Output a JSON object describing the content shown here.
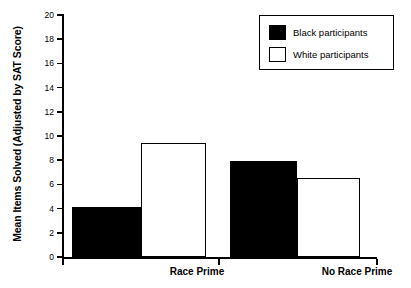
{
  "chart_data": {
    "type": "bar",
    "title": "",
    "subtitle": "",
    "xlabel": "",
    "ylabel": "Mean Items Solved (Adjusted by SAT Score)",
    "categories": [
      "Race Prime",
      "No Race Prime"
    ],
    "series": [
      {
        "name": "Black participants",
        "values": [
          4.1,
          7.9
        ],
        "color": "#000000",
        "fill": "solid"
      },
      {
        "name": "White participants",
        "values": [
          9.4,
          6.5
        ],
        "color": "#ffffff",
        "fill": "open"
      }
    ],
    "ylim": [
      0,
      20
    ],
    "ytick_labels": [
      "0",
      "2",
      "4",
      "6",
      "8",
      "10",
      "12",
      "14",
      "16",
      "18",
      "20"
    ],
    "ytick_values": [
      0,
      2,
      4,
      6,
      8,
      10,
      12,
      14,
      16,
      18,
      20
    ],
    "grid": false,
    "legend_position": "top-right",
    "legend_entries": [
      "Black participants",
      "White participants"
    ],
    "background_color": "#ffffff",
    "axis_color": "#000000"
  }
}
